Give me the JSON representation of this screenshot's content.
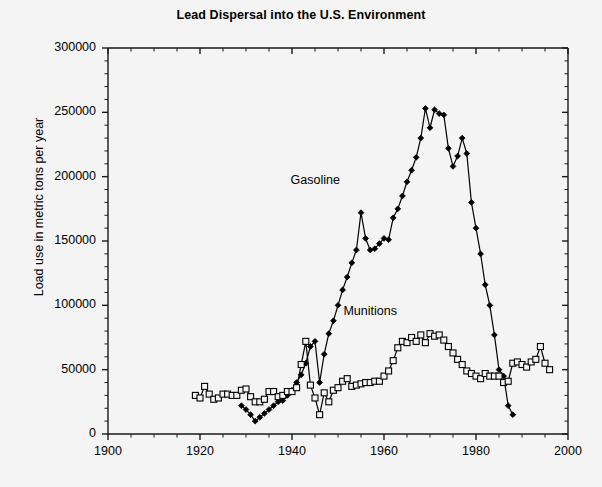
{
  "chart_data": {
    "type": "line",
    "title": "Lead Dispersal into the U.S. Environment",
    "xlabel": "",
    "ylabel": "Load use in metric tons per year",
    "xlim": [
      1900,
      2000
    ],
    "ylim": [
      0,
      300000
    ],
    "xticks": [
      1900,
      1920,
      1940,
      1960,
      1980,
      2000
    ],
    "xtick_labels": [
      "1900",
      "1920",
      "1940",
      "1960",
      "1980",
      "2000"
    ],
    "yticks": [
      0,
      50000,
      100000,
      150000,
      200000,
      250000,
      300000
    ],
    "ytick_labels": [
      "0",
      "50000",
      "100000",
      "150000",
      "200000",
      "250000",
      "300000"
    ],
    "minor_xtick_step": 5,
    "minor_ytick_step": 10000,
    "grid": false,
    "legend_position": "inline-annotation",
    "annotations": [
      {
        "text": "Gasoline",
        "x": 1947.5,
        "y": 197000
      },
      {
        "text": "Munitions",
        "x": 1959.0,
        "y": 95000
      }
    ],
    "series": [
      {
        "name": "Gasoline",
        "marker": "filled-diamond",
        "color": "#000000",
        "x": [
          1929,
          1930,
          1931,
          1932,
          1933,
          1934,
          1935,
          1936,
          1937,
          1938,
          1939,
          1940,
          1941,
          1942,
          1943,
          1944,
          1945,
          1946,
          1947,
          1948,
          1949,
          1950,
          1951,
          1952,
          1953,
          1954,
          1955,
          1956,
          1957,
          1958,
          1959,
          1960,
          1961,
          1962,
          1963,
          1964,
          1965,
          1966,
          1967,
          1968,
          1969,
          1970,
          1971,
          1972,
          1973,
          1974,
          1975,
          1976,
          1977,
          1978,
          1979,
          1980,
          1981,
          1982,
          1983,
          1984,
          1985,
          1986,
          1987,
          1988
        ],
        "y": [
          22000,
          19000,
          15000,
          10000,
          13000,
          16000,
          19000,
          22000,
          25000,
          26000,
          30000,
          34000,
          40000,
          46000,
          55000,
          68000,
          72000,
          40000,
          62000,
          78000,
          88000,
          100000,
          112000,
          122000,
          133000,
          143000,
          172000,
          152000,
          143000,
          144000,
          148000,
          152000,
          151000,
          168000,
          175000,
          185000,
          196000,
          205000,
          215000,
          230000,
          253000,
          238000,
          252000,
          249000,
          248000,
          222000,
          208000,
          216000,
          230000,
          218000,
          180000,
          160000,
          140000,
          116000,
          100000,
          77000,
          50000,
          45000,
          22000,
          15000
        ]
      },
      {
        "name": "Munitions",
        "marker": "open-square",
        "color": "#000000",
        "x": [
          1919,
          1920,
          1921,
          1922,
          1923,
          1924,
          1925,
          1926,
          1927,
          1928,
          1929,
          1930,
          1931,
          1932,
          1933,
          1934,
          1935,
          1936,
          1937,
          1938,
          1939,
          1940,
          1941,
          1942,
          1943,
          1944,
          1945,
          1946,
          1947,
          1948,
          1949,
          1950,
          1951,
          1952,
          1953,
          1954,
          1955,
          1956,
          1957,
          1958,
          1959,
          1960,
          1961,
          1962,
          1963,
          1964,
          1965,
          1966,
          1967,
          1968,
          1969,
          1970,
          1971,
          1972,
          1973,
          1974,
          1975,
          1976,
          1977,
          1978,
          1979,
          1980,
          1981,
          1982,
          1983,
          1984,
          1985,
          1986,
          1987,
          1988,
          1989,
          1990,
          1991,
          1992,
          1993,
          1994,
          1995,
          1996
        ],
        "y": [
          30000,
          28000,
          37000,
          31000,
          27000,
          28000,
          31000,
          31000,
          30000,
          30000,
          34000,
          35000,
          29000,
          25000,
          25000,
          27000,
          33000,
          33000,
          29000,
          30000,
          33000,
          33000,
          36000,
          54000,
          72000,
          38000,
          28000,
          15000,
          32000,
          25000,
          34000,
          36000,
          41000,
          43000,
          37000,
          38000,
          39000,
          40000,
          40000,
          41000,
          41000,
          45000,
          49000,
          57000,
          67000,
          72000,
          71000,
          75000,
          72000,
          77000,
          71000,
          78000,
          76000,
          77000,
          73000,
          68000,
          63000,
          58000,
          54000,
          49000,
          47000,
          45000,
          43000,
          47000,
          45000,
          45000,
          45000,
          40000,
          41000,
          55000,
          56000,
          54000,
          52000,
          56000,
          58000,
          68000,
          55000,
          50000
        ]
      }
    ]
  }
}
